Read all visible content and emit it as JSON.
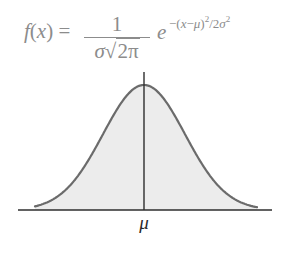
{
  "formula": {
    "lhs_func": "f",
    "lhs_open": "(",
    "lhs_var": "x",
    "lhs_close": ")",
    "equals": " = ",
    "numerator": "1",
    "denominator_sigma": "σ",
    "sqrt_symbol": "√",
    "denominator_radicand": "2π",
    "exp_base": "e",
    "exp_sign": "−(",
    "exp_var": "x",
    "exp_minus": "−",
    "exp_mu": "μ",
    "exp_close": ")",
    "exp_sq": "2",
    "exp_div": "/2",
    "exp_sigma": "σ",
    "exp_sq2": "2",
    "text_color": "#8c8c8c"
  },
  "diagram": {
    "type": "normal-distribution-curve",
    "mean_label": "μ",
    "colors": {
      "curve": "#6b6b6b",
      "fill": "#ececec",
      "axis": "#2e2e2e",
      "mean_line": "#2e2e2e",
      "label": "#2a2a2a"
    },
    "geometry": {
      "axis_y": 210,
      "axis_x_start": 18,
      "axis_x_end": 272,
      "mean_x": 144,
      "mean_line_top": 72,
      "peak_y": 85,
      "sigma_px": 41,
      "curve_x_start": 35,
      "curve_x_end": 257
    }
  },
  "chart_data": {
    "type": "area",
    "xlabel": "",
    "ylabel": "",
    "tick_labels": [
      "μ"
    ],
    "annotations": [
      "vertical line at mean μ"
    ],
    "x_range_sigma": [
      -2.65,
      2.75
    ],
    "grid": false,
    "legend": null
  }
}
